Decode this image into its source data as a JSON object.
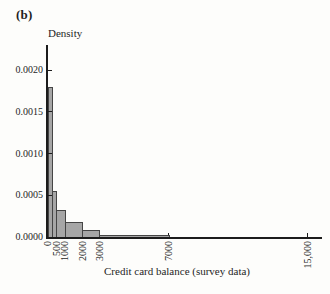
{
  "figure_label": "(b)",
  "chart_data": {
    "type": "bar",
    "subtype": "density-histogram",
    "title": "",
    "ylabel": "Density",
    "xlabel": "Credit card balance (survey data)",
    "bins": [
      {
        "from": 0,
        "to": 250,
        "density": 0.0018
      },
      {
        "from": 250,
        "to": 500,
        "density": 0.00055
      },
      {
        "from": 500,
        "to": 1000,
        "density": 0.00032
      },
      {
        "from": 1000,
        "to": 2000,
        "density": 0.00018
      },
      {
        "from": 2000,
        "to": 3000,
        "density": 8e-05
      },
      {
        "from": 3000,
        "to": 7000,
        "density": 2e-05
      }
    ],
    "x_ticks": [
      {
        "value": 0,
        "label": "0"
      },
      {
        "value": 500,
        "label": "500"
      },
      {
        "value": 1000,
        "label": "1000"
      },
      {
        "value": 2000,
        "label": "2000"
      },
      {
        "value": 3000,
        "label": "3000"
      },
      {
        "value": 7000,
        "label": "7000"
      },
      {
        "value": 15000,
        "label": "15,000"
      }
    ],
    "y_ticks": [
      {
        "value": 0.0,
        "label": "0.0000"
      },
      {
        "value": 0.0005,
        "label": "0.0005"
      },
      {
        "value": 0.001,
        "label": "0.0010"
      },
      {
        "value": 0.0015,
        "label": "0.0015"
      },
      {
        "value": 0.002,
        "label": "0.0020"
      }
    ],
    "xlim": [
      0,
      15900
    ],
    "ylim": [
      0,
      0.0023
    ],
    "grid": false,
    "legend": null,
    "colors": {
      "bar_fill": "#a6a6a6",
      "bar_edge": "#454545",
      "axis": "#1c1c1c",
      "text": "#1f1f1f",
      "background": "#fdfdfb"
    }
  }
}
